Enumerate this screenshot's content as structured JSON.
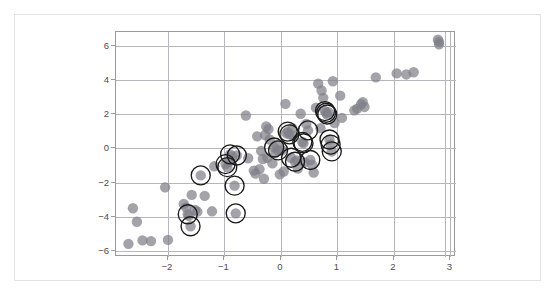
{
  "figure": {
    "title": "",
    "background_color": "#ffffff",
    "frame_color": "#e2e2e2",
    "axes_color": "#9a9a9a",
    "grid_color": "#b6b6bd",
    "point_color": "#808088",
    "highlight_color": "#1b1b1b"
  },
  "chart_data": {
    "type": "scatter",
    "title": "",
    "subtitle": "",
    "xlabel": "",
    "ylabel": "",
    "xlim": [
      -2.92,
      3.1
    ],
    "ylim": [
      -6.35,
      6.8
    ],
    "xticks": [
      -2,
      -1,
      0,
      1,
      2,
      3
    ],
    "xtick_labels": [
      "−2",
      "−1",
      "0",
      "1",
      "2",
      "3"
    ],
    "yticks": [
      -6,
      -4,
      -2,
      0,
      2,
      4,
      6
    ],
    "ytick_labels": [
      "−6",
      "−4",
      "−2",
      "0",
      "2",
      "4",
      "6"
    ],
    "grid": true,
    "grid_axes": "both",
    "legend": null,
    "legend_position": "none",
    "annotations": [],
    "series": [
      {
        "name": "observations",
        "marker": "circle",
        "marker_size": 5.2,
        "color": "#808088",
        "opacity": 0.72,
        "points": [
          [
            -2.7,
            -5.58
          ],
          [
            -2.62,
            -3.5
          ],
          [
            -2.55,
            -4.29
          ],
          [
            -2.45,
            -5.38
          ],
          [
            -2.3,
            -5.42
          ],
          [
            -2.05,
            -2.28
          ],
          [
            -2.0,
            -5.35
          ],
          [
            -1.72,
            -3.25
          ],
          [
            -1.68,
            -3.45
          ],
          [
            -1.65,
            -3.85
          ],
          [
            -1.63,
            -3.95
          ],
          [
            -1.6,
            -4.55
          ],
          [
            -1.58,
            -2.72
          ],
          [
            -1.52,
            -3.6
          ],
          [
            -1.48,
            -3.7
          ],
          [
            -1.42,
            -1.58
          ],
          [
            -1.35,
            -2.78
          ],
          [
            -1.22,
            -3.68
          ],
          [
            -1.18,
            -1.05
          ],
          [
            -0.98,
            -0.92
          ],
          [
            -0.95,
            -1.1
          ],
          [
            -0.92,
            -0.78
          ],
          [
            -0.9,
            -0.35
          ],
          [
            -0.86,
            -0.48
          ],
          [
            -0.82,
            -2.18
          ],
          [
            -0.8,
            -3.8
          ],
          [
            -0.78,
            -0.42
          ],
          [
            -0.62,
            1.92
          ],
          [
            -0.58,
            -0.58
          ],
          [
            -0.48,
            -1.3
          ],
          [
            -0.45,
            -1.48
          ],
          [
            -0.42,
            0.7
          ],
          [
            -0.38,
            -1.22
          ],
          [
            -0.35,
            -0.15
          ],
          [
            -0.32,
            -0.62
          ],
          [
            -0.3,
            -1.78
          ],
          [
            -0.28,
            0.78
          ],
          [
            -0.26,
            1.28
          ],
          [
            -0.24,
            -0.55
          ],
          [
            -0.22,
            1.12
          ],
          [
            -0.2,
            0.52
          ],
          [
            -0.15,
            -0.88
          ],
          [
            -0.12,
            0.05
          ],
          [
            -0.1,
            -0.28
          ],
          [
            -0.08,
            0.18
          ],
          [
            -0.05,
            -0.12
          ],
          [
            -0.02,
            -1.52
          ],
          [
            0.02,
            -0.12
          ],
          [
            0.05,
            -1.35
          ],
          [
            0.08,
            2.6
          ],
          [
            0.1,
            0.88
          ],
          [
            0.12,
            0.98
          ],
          [
            0.15,
            0.82
          ],
          [
            0.18,
            -0.55
          ],
          [
            0.2,
            1.18
          ],
          [
            0.22,
            0.72
          ],
          [
            0.25,
            -0.78
          ],
          [
            0.28,
            -0.7
          ],
          [
            0.3,
            -1.18
          ],
          [
            0.35,
            2.02
          ],
          [
            0.38,
            0.38
          ],
          [
            0.4,
            0.3
          ],
          [
            0.42,
            -0.82
          ],
          [
            0.45,
            1.42
          ],
          [
            0.48,
            1.05
          ],
          [
            0.52,
            -0.68
          ],
          [
            0.55,
            -0.95
          ],
          [
            0.58,
            -1.42
          ],
          [
            0.62,
            2.38
          ],
          [
            0.66,
            3.78
          ],
          [
            0.7,
            1.18
          ],
          [
            0.72,
            3.38
          ],
          [
            0.75,
            2.95
          ],
          [
            0.78,
            2.18
          ],
          [
            0.8,
            2.08
          ],
          [
            0.82,
            1.98
          ],
          [
            0.84,
            2.12
          ],
          [
            0.86,
            0.52
          ],
          [
            0.88,
            0.22
          ],
          [
            0.9,
            -0.18
          ],
          [
            0.92,
            3.92
          ],
          [
            0.95,
            1.48
          ],
          [
            1.05,
            3.08
          ],
          [
            1.08,
            1.78
          ],
          [
            1.3,
            2.22
          ],
          [
            1.35,
            2.32
          ],
          [
            1.42,
            2.58
          ],
          [
            1.45,
            2.7
          ],
          [
            1.48,
            2.42
          ],
          [
            1.68,
            4.15
          ],
          [
            2.05,
            4.38
          ],
          [
            2.22,
            4.32
          ],
          [
            2.35,
            4.45
          ],
          [
            2.78,
            6.35
          ],
          [
            2.8,
            6.08
          ],
          [
            2.8,
            6.22
          ]
        ]
      }
    ],
    "highlighted_points": {
      "name": "selected-subset",
      "marker": "open-circle-ring",
      "ring_radius_px": 9.5,
      "stroke_color": "#1b1b1b",
      "points": [
        [
          -1.42,
          -1.58
        ],
        [
          -1.65,
          -3.85
        ],
        [
          -1.6,
          -4.55
        ],
        [
          -0.95,
          -1.1
        ],
        [
          -0.98,
          -0.92
        ],
        [
          -0.9,
          -0.35
        ],
        [
          -0.78,
          -0.42
        ],
        [
          -0.82,
          -2.18
        ],
        [
          -0.8,
          -3.8
        ],
        [
          -0.12,
          0.05
        ],
        [
          -0.05,
          -0.12
        ],
        [
          0.12,
          0.98
        ],
        [
          0.15,
          0.82
        ],
        [
          0.18,
          -0.55
        ],
        [
          0.25,
          -0.78
        ],
        [
          0.38,
          0.38
        ],
        [
          0.4,
          0.3
        ],
        [
          0.48,
          1.05
        ],
        [
          0.52,
          -0.68
        ],
        [
          0.78,
          2.18
        ],
        [
          0.8,
          2.08
        ],
        [
          0.82,
          1.98
        ],
        [
          0.86,
          0.52
        ],
        [
          0.88,
          0.22
        ],
        [
          0.9,
          -0.18
        ]
      ]
    },
    "extra_vertical_line_x": 2.9
  }
}
